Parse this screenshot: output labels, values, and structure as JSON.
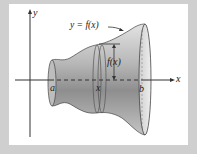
{
  "diagram": {
    "type": "solid of revolution",
    "labels": {
      "y_axis": "y",
      "x_axis": "x",
      "curve": "y = f(x)",
      "radius": "f(x)",
      "a": "a",
      "x_point": "x",
      "b": "b"
    },
    "colors": {
      "frame": "#cfcfcf",
      "panel": "#ffffff",
      "solid_light": "#d9d9d9",
      "solid_dark": "#8a8a8a",
      "axis": "#333333"
    }
  }
}
